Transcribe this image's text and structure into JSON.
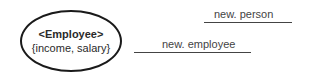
{
  "diagram": {
    "node": {
      "name": "<Employee>",
      "attributes": "{income, salary}"
    },
    "edges": [
      {
        "label": "new. person"
      },
      {
        "label": "new. employee"
      }
    ],
    "colors": {
      "outline": "#1a1a1a",
      "text": "#2a2a2a",
      "line": "#444444"
    }
  }
}
